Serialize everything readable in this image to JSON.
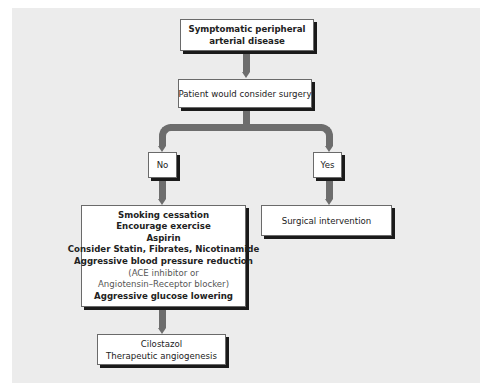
{
  "diagram": {
    "type": "flowchart",
    "colors": {
      "background_panel": "#ececec",
      "connector": "#6d6d6d",
      "box_fill": "#ffffff",
      "box_shadow": "#1a1a1a"
    },
    "nodes": {
      "start": {
        "lines": [
          "Symptomatic peripheral",
          "arterial disease"
        ]
      },
      "decision": {
        "lines": [
          "Patient would consider surgery"
        ]
      },
      "no": {
        "label": "No"
      },
      "yes": {
        "label": "Yes"
      },
      "medical": {
        "lines": [
          "Smoking cessation",
          "Encourage exercise",
          "Aspirin",
          "Consider Statin, Fibrates, Nicotinamide",
          "Aggressive blood pressure reduction",
          "(ACE inhibitor or",
          "Angiotensin–Receptor blocker)",
          "Aggressive glucose lowering"
        ]
      },
      "surgical": {
        "lines": [
          "Surgical intervention"
        ]
      },
      "adjunct": {
        "lines": [
          "Cilostazol",
          "Therapeutic angiogenesis"
        ]
      }
    },
    "edges": [
      {
        "from": "start",
        "to": "decision"
      },
      {
        "from": "decision",
        "to": "no"
      },
      {
        "from": "decision",
        "to": "yes"
      },
      {
        "from": "no",
        "to": "medical"
      },
      {
        "from": "yes",
        "to": "surgical"
      },
      {
        "from": "medical",
        "to": "adjunct"
      }
    ]
  }
}
